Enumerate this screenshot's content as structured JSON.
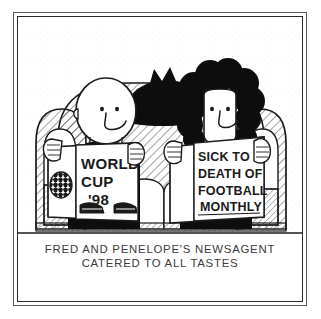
{
  "artwork": {
    "type": "cartoon-comic-panel",
    "title": "Fred and Penelope's Newsagent cartoon",
    "background_color": "#ffffff",
    "ink_color": "#1a1a1a",
    "frame": {
      "outer_border_color": "#5a5a5a",
      "inner_border_color": "#2a2a2a"
    }
  },
  "caption": {
    "line1": "FRED AND PENELOPE'S NEWSAGENT",
    "line2": "CATERED TO ALL TASTES"
  },
  "magazines": {
    "left": {
      "name": "World Cup magazine",
      "lines": [
        "WORLD",
        "CUP",
        "'98"
      ],
      "cover_art": [
        "soccer-ball",
        "football-boot",
        "football-boot"
      ]
    },
    "right": {
      "name": "Sick To Death Of Football Monthly",
      "lines": [
        "SICK TO",
        "DEATH OF",
        "FOOTBALL",
        "MONTHLY"
      ]
    }
  },
  "characters": {
    "left": {
      "name": "Fred",
      "hair": "bald",
      "expression": "smiling"
    },
    "right": {
      "name": "Penelope",
      "hair": "large curly black afro",
      "expression": "smiling"
    }
  },
  "pets": {
    "cat": {
      "name": "black cat",
      "position": "sitting on sofa back between the two figures",
      "color": "#101010"
    }
  },
  "furniture": {
    "sofa": {
      "name": "hatched armchair sofa",
      "shading": "diagonal hatching"
    }
  }
}
